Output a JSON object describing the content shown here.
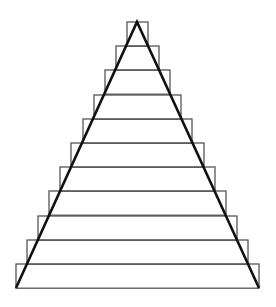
{
  "diagram": {
    "canvas": {
      "width": 276,
      "height": 307,
      "background": "#ffffff"
    },
    "triangle": {
      "apex": [
        137,
        22
      ],
      "base_left": [
        16,
        288
      ],
      "base_right": [
        259,
        288
      ],
      "stroke": "#111111",
      "stroke_width": 2.6
    },
    "rectangles": {
      "count": 11,
      "stroke": "#555555",
      "stroke_width": 1.3,
      "rows": [
        {
          "x": 127,
          "y": 22,
          "w": 21,
          "h": 24.2
        },
        {
          "x": 116,
          "y": 46,
          "w": 43,
          "h": 24.2
        },
        {
          "x": 105,
          "y": 70,
          "w": 65,
          "h": 24.2
        },
        {
          "x": 94,
          "y": 95,
          "w": 87,
          "h": 24.2
        },
        {
          "x": 83,
          "y": 119,
          "w": 109,
          "h": 24.2
        },
        {
          "x": 71,
          "y": 143,
          "w": 133,
          "h": 24.2
        },
        {
          "x": 60,
          "y": 167,
          "w": 155,
          "h": 24.2
        },
        {
          "x": 49,
          "y": 191,
          "w": 177,
          "h": 24.2
        },
        {
          "x": 38,
          "y": 216,
          "w": 199,
          "h": 24.2
        },
        {
          "x": 27,
          "y": 240,
          "w": 221,
          "h": 24.2
        },
        {
          "x": 16,
          "y": 264,
          "w": 243,
          "h": 24.2
        }
      ]
    }
  }
}
